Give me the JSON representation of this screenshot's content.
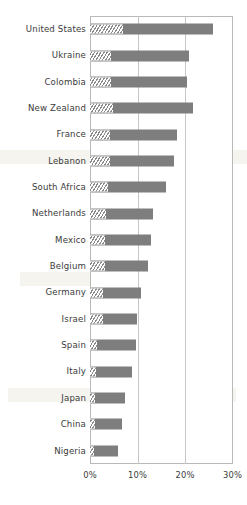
{
  "chart_data": {
    "type": "bar",
    "orientation": "horizontal",
    "title": "",
    "subtitle": "",
    "xlabel": "",
    "ylabel": "",
    "xlim": [
      0,
      30
    ],
    "xunit": "%",
    "grid": true,
    "legend_position": "none",
    "xticks": [
      "0%",
      "10%",
      "20%",
      "30%"
    ],
    "xtick_values": [
      0,
      10,
      20,
      30
    ],
    "categories": [
      "United States",
      "Ukraine",
      "Colombia",
      "New Zealand",
      "France",
      "Lebanon",
      "South Africa",
      "Netherlands",
      "Mexico",
      "Belgium",
      "Germany",
      "Israel",
      "Spain",
      "Italy",
      "Japan",
      "China",
      "Nigeria"
    ],
    "series": [
      {
        "name": "hatched-segment",
        "style": "diagonal-hatch",
        "color": "#8a8a8a",
        "values": [
          7.0,
          4.4,
          4.4,
          4.8,
          4.2,
          4.2,
          3.8,
          3.4,
          3.2,
          3.2,
          2.7,
          2.7,
          1.5,
          1.3,
          1.1,
          1.1,
          0.8
        ]
      },
      {
        "name": "solid-segment",
        "style": "solid",
        "color": "#7e7e7e",
        "values": [
          18.9,
          16.4,
          16.0,
          16.9,
          14.1,
          13.5,
          12.2,
          9.9,
          9.6,
          9.0,
          8.0,
          7.2,
          8.2,
          7.5,
          6.3,
          5.6,
          5.1
        ]
      }
    ],
    "totals": [
      25.9,
      20.8,
      20.4,
      21.7,
      18.3,
      17.7,
      16.0,
      13.3,
      12.8,
      12.2,
      10.7,
      9.9,
      9.7,
      8.8,
      7.4,
      6.7,
      5.9
    ]
  },
  "colors": {
    "bar_solid": "#7e7e7e",
    "bar_hatch": "#8a8a8a",
    "gridline": "#c6c6c6",
    "frame": "#b9b9b9",
    "text": "#3b3b3b",
    "background": "#ffffff"
  }
}
